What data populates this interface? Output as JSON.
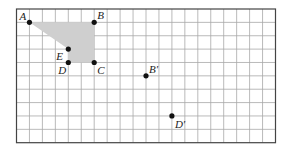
{
  "diagram": {
    "grid": {
      "origin_x": 16.5,
      "origin_y": 9,
      "cell_w": 12.95,
      "cell_h": 13.37,
      "cols": 20,
      "rows": 10,
      "line_color": "#a8a8a8",
      "border_color": "#444444"
    },
    "polygon": {
      "vertices": [
        "A",
        "B",
        "C",
        "D",
        "E"
      ],
      "fill": "#cfcfcf"
    },
    "points": [
      {
        "name": "A",
        "label": "A",
        "col": 1,
        "row": 1,
        "dx": -10,
        "dy": -2
      },
      {
        "name": "B",
        "label": "B",
        "col": 6,
        "row": 1,
        "dx": 3,
        "dy": -3
      },
      {
        "name": "C",
        "label": "C",
        "col": 6,
        "row": 4,
        "dx": 3,
        "dy": 12
      },
      {
        "name": "D",
        "label": "D",
        "col": 4,
        "row": 4,
        "dx": -10,
        "dy": 12
      },
      {
        "name": "E",
        "label": "E",
        "col": 4,
        "row": 3,
        "dx": -12,
        "dy": 11
      },
      {
        "name": "B-prime",
        "label": "B′",
        "col": 10,
        "row": 5,
        "dx": 3,
        "dy": -3
      },
      {
        "name": "D-prime",
        "label": "D′",
        "col": 12,
        "row": 8,
        "dx": 3,
        "dy": 12
      }
    ]
  }
}
